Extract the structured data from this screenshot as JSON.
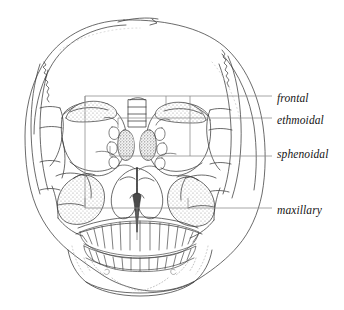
{
  "figure": {
    "background_color": "#ffffff",
    "ink_color": "#3a3a3a",
    "leader_color": "#8a8a8a",
    "stipple_color": "#9a9a9a",
    "label_color": "#141414"
  },
  "labels": [
    {
      "id": "frontal",
      "text": "frontal",
      "sinus": "frontal-sinus",
      "leader": {
        "x1": 85,
        "y1": 96,
        "x2": 272,
        "y2": 96
      }
    },
    {
      "id": "ethmoidal",
      "text": "ethmoidal",
      "sinus": "ethmoidal-sinus",
      "leader": {
        "x1": 118,
        "y1": 118,
        "x2": 272,
        "y2": 118
      }
    },
    {
      "id": "sphenoidal",
      "text": "sphenoidal",
      "sinus": "sphenoidal-sinus",
      "leader": {
        "x1": 110,
        "y1": 156,
        "x2": 272,
        "y2": 156
      }
    },
    {
      "id": "maxillary",
      "text": "maxillary",
      "sinus": "maxillary-sinus",
      "leader": {
        "x1": 85,
        "y1": 208,
        "x2": 272,
        "y2": 208
      }
    }
  ],
  "anatomy": {
    "cranium": "cranial-vault",
    "orbits": [
      "left-orbit",
      "right-orbit"
    ],
    "nasal_cavity": "nasal-cavity",
    "nasal_septum": "nasal-septum",
    "maxilla": "maxilla",
    "mandible": "mandible",
    "upper_teeth_count": 16,
    "lower_teeth_count": 16
  }
}
